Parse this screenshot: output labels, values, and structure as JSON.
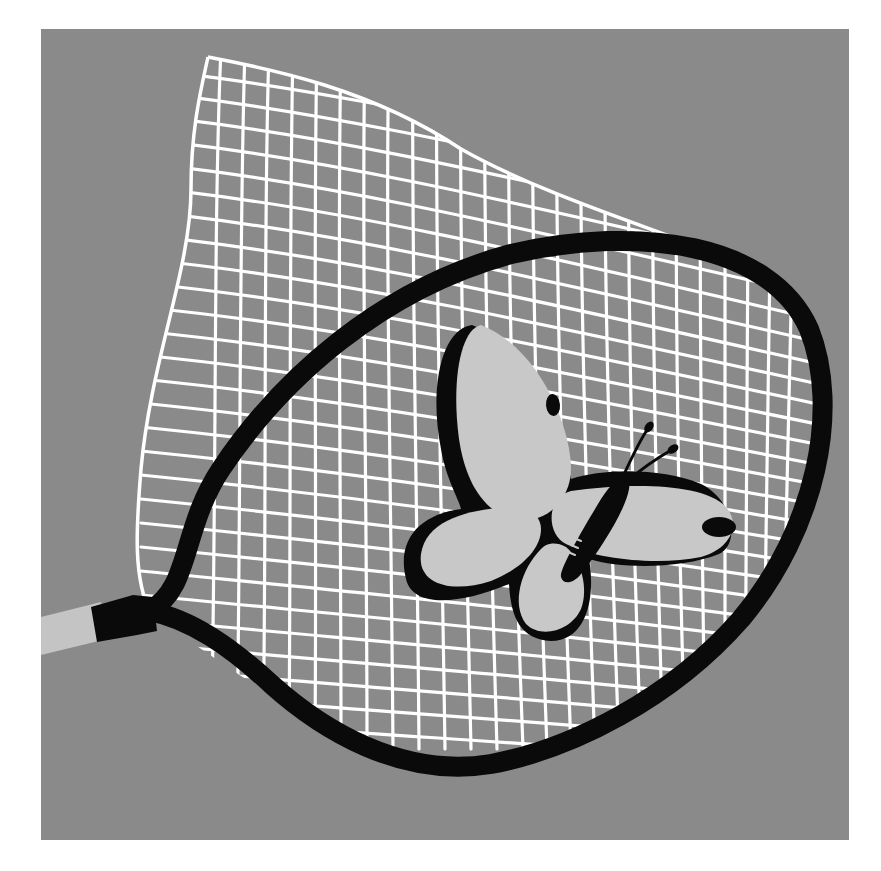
{
  "illustration": {
    "subject": "butterfly caught in a net",
    "style": "flat grayscale illustration",
    "colors": {
      "page_background": "#ffffff",
      "panel_background": "#8a8a8a",
      "net_mesh": "#ffffff",
      "hoop_frame": "#0a0a0a",
      "handle": "#c4c4c4",
      "ferrule": "#0a0a0a",
      "butterfly_wings": "#c8c8c8",
      "butterfly_shadow": "#0a0a0a",
      "butterfly_body": "#0a0a0a",
      "wing_spots": "#0a0a0a"
    },
    "elements": {
      "panel": "gray square backdrop",
      "net": "white hand-drawn mesh net billowing up and to the left",
      "hoop": "black oval net frame",
      "handle": "light gray handle entering from left edge",
      "ferrule": "black ferrule connecting handle to hoop",
      "butterfly": "light gray butterfly with black drop shadow, two wing spots, striped body and clubbed antennae"
    }
  }
}
